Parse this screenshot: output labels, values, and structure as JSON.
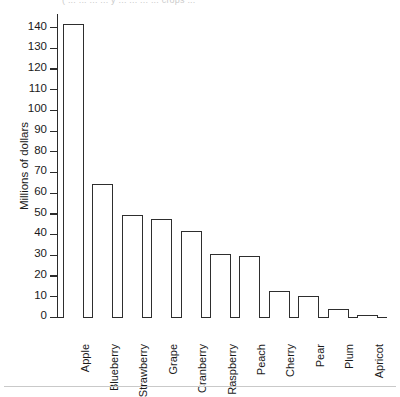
{
  "top_caption_fragment": "(      ...   ... ... ...  y ... ... ...  ...  crops ...",
  "chart_data": {
    "type": "bar",
    "title": "",
    "xlabel": "",
    "ylabel": "Millions of dollars",
    "categories": [
      "Apple",
      "Blueberry",
      "Strawberry",
      "Grape",
      "Cranberry",
      "Raspberry",
      "Peach",
      "Cherry",
      "Pear",
      "Plum",
      "Apricot"
    ],
    "values": [
      142,
      65,
      50,
      48,
      42,
      31,
      30,
      13,
      10.5,
      4.5,
      1.5
    ],
    "ylim": [
      0,
      145
    ],
    "ytick_values": [
      0,
      10,
      20,
      30,
      40,
      50,
      60,
      70,
      80,
      90,
      100,
      110,
      120,
      130,
      140
    ],
    "ytick_labels": [
      "0",
      "10",
      "20",
      "30",
      "40",
      "50",
      "60",
      "70",
      "80",
      "90",
      "100",
      "110",
      "120",
      "130",
      "140"
    ],
    "grid": false,
    "legend": null,
    "bar_style": {
      "fill": "#ffffff",
      "edge": "#2e2e2e"
    }
  }
}
